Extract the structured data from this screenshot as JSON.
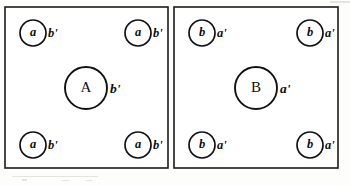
{
  "figure": {
    "type": "diagram",
    "background_color": "#fdfdfc",
    "line_color": "#1b1b1b",
    "text_color": "#0d0d0d"
  },
  "panels": [
    {
      "id": "panel-left",
      "name": "panel-a",
      "rect": {
        "x": 5,
        "y": 7,
        "width": 163,
        "height": 161
      },
      "center_node": {
        "name": "center-node-a",
        "inner_label": "A",
        "side_label": "b'",
        "cx": 86,
        "cy": 88,
        "r": 21,
        "label_size": "big"
      },
      "corner_nodes": [
        {
          "name": "corner-node-top-left",
          "inner_label": "a",
          "side_label": "b'",
          "cx": 33,
          "cy": 33,
          "r": 13
        },
        {
          "name": "corner-node-top-right",
          "inner_label": "a",
          "side_label": "b'",
          "cx": 138,
          "cy": 33,
          "r": 13
        },
        {
          "name": "corner-node-bottom-left",
          "inner_label": "a",
          "side_label": "b'",
          "cx": 33,
          "cy": 145,
          "r": 13
        },
        {
          "name": "corner-node-bottom-right",
          "inner_label": "a",
          "side_label": "b'",
          "cx": 138,
          "cy": 145,
          "r": 13
        }
      ]
    },
    {
      "id": "panel-right",
      "name": "panel-b",
      "rect": {
        "x": 174,
        "y": 7,
        "width": 164,
        "height": 161
      },
      "center_node": {
        "name": "center-node-b",
        "inner_label": "B",
        "side_label": "a'",
        "cx": 256,
        "cy": 88,
        "r": 21,
        "label_size": "big"
      },
      "corner_nodes": [
        {
          "name": "corner-node-top-left",
          "inner_label": "b",
          "side_label": "a'",
          "cx": 202,
          "cy": 33,
          "r": 13
        },
        {
          "name": "corner-node-top-right",
          "inner_label": "b",
          "side_label": "a'",
          "cx": 310,
          "cy": 33,
          "r": 13
        },
        {
          "name": "corner-node-bottom-left",
          "inner_label": "b",
          "side_label": "a'",
          "cx": 202,
          "cy": 145,
          "r": 13
        },
        {
          "name": "corner-node-bottom-right",
          "inner_label": "b",
          "side_label": "a'",
          "cx": 310,
          "cy": 145,
          "r": 13
        }
      ]
    }
  ]
}
